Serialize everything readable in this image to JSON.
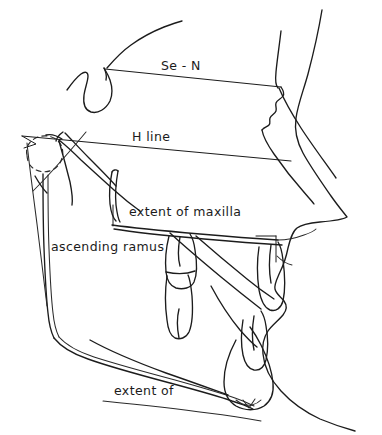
{
  "figure": {
    "type": "cephalometric-tracing",
    "background_color": "#ffffff",
    "line_color": "#1c1c1c",
    "width": 382,
    "height": 435
  },
  "labels": {
    "se_n": "Se - N",
    "h_line": "H line",
    "extent_of_maxilla": "extent of maxilla",
    "ascending_ramus": "ascending ramus",
    "extent_of": "extent of"
  },
  "reference_lines": [
    {
      "name": "se-n-line",
      "label": "Se - N",
      "from": [
        105,
        69
      ],
      "to": [
        281,
        87
      ]
    },
    {
      "name": "h-line",
      "label": "H line",
      "from": [
        22,
        136
      ],
      "to": [
        291,
        161
      ]
    }
  ],
  "anatomy": [
    {
      "name": "soft-tissue-profile"
    },
    {
      "name": "cranial-base-outline"
    },
    {
      "name": "sella-turcica"
    },
    {
      "name": "frontal-sinus-nasion"
    },
    {
      "name": "condyle-outline-dashed"
    },
    {
      "name": "ascending-ramus"
    },
    {
      "name": "mandible-body"
    },
    {
      "name": "mandibular-symphysis"
    },
    {
      "name": "palatal-plane"
    },
    {
      "name": "maxillary-molar"
    },
    {
      "name": "mandibular-molar"
    },
    {
      "name": "maxillary-incisor"
    },
    {
      "name": "mandibular-incisor"
    },
    {
      "name": "pterygomaxillary-fissure"
    },
    {
      "name": "maxilla-extent-bracket"
    }
  ]
}
